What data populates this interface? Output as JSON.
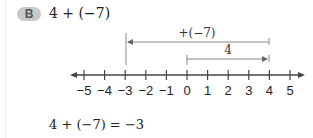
{
  "problem": {
    "badge": "B",
    "expression": "4 + (−7)",
    "result": "4 + (−7) = −3"
  },
  "number_line": {
    "ticks": [
      "−5",
      "−4",
      "−3",
      "−2",
      "−1",
      "0",
      "1",
      "2",
      "3",
      "4",
      "5"
    ],
    "arrows": [
      {
        "label": "+(−7)",
        "from": 4,
        "to": -3
      },
      {
        "label": "4",
        "from": 0,
        "to": 4
      }
    ],
    "colors": {
      "line": "#444444",
      "arrow": "#777777",
      "badge": "#c9c9c9"
    }
  }
}
